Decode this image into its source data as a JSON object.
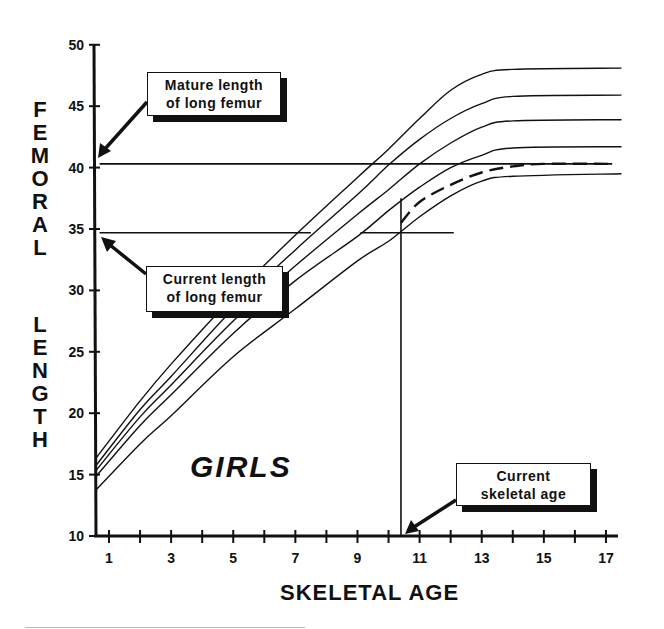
{
  "chart_data": {
    "type": "line",
    "title": "",
    "subtitle": "GIRLS",
    "xlabel": "SKELETAL AGE",
    "ylabel": "FEMORAL LENGTH",
    "xlim": [
      0.6,
      18
    ],
    "ylim": [
      10,
      50
    ],
    "x_ticks": [
      1,
      2,
      3,
      4,
      5,
      6,
      7,
      8,
      9,
      10,
      11,
      12,
      13,
      14,
      15,
      16,
      17
    ],
    "x_tick_labels": [
      "1",
      "3",
      "5",
      "7",
      "9",
      "11",
      "13",
      "15",
      "17"
    ],
    "y_ticks": [
      10,
      15,
      20,
      25,
      30,
      35,
      40,
      45,
      50
    ],
    "y_tick_labels": [
      "10",
      "15",
      "20",
      "25",
      "30",
      "35",
      "40",
      "45",
      "50"
    ],
    "grid": false,
    "legend": null,
    "x": [
      0.6,
      2,
      3,
      5,
      7,
      9,
      10,
      11,
      12,
      13,
      14,
      17.5
    ],
    "series": [
      {
        "name": "curve-1 (highest)",
        "style": "solid",
        "values": [
          16.4,
          21.0,
          24.0,
          29.5,
          34.5,
          39.2,
          41.5,
          44.0,
          46.3,
          47.6,
          48.0,
          48.1
        ]
      },
      {
        "name": "curve-2",
        "style": "solid",
        "values": [
          15.8,
          20.3,
          23.0,
          28.5,
          33.3,
          37.8,
          40.2,
          42.3,
          44.0,
          45.2,
          45.8,
          45.9
        ]
      },
      {
        "name": "curve-3",
        "style": "solid",
        "values": [
          15.4,
          19.7,
          22.3,
          27.5,
          32.0,
          36.2,
          38.2,
          40.3,
          42.0,
          43.3,
          43.8,
          43.9
        ]
      },
      {
        "name": "curve-4",
        "style": "solid",
        "values": [
          14.9,
          19.0,
          21.5,
          26.5,
          30.8,
          34.4,
          36.5,
          38.4,
          40.0,
          41.0,
          41.6,
          41.7
        ]
      },
      {
        "name": "curve-5 (lowest)",
        "style": "solid",
        "values": [
          13.8,
          17.5,
          19.8,
          24.6,
          28.5,
          32.4,
          34.0,
          36.0,
          37.7,
          38.9,
          39.3,
          39.5
        ]
      },
      {
        "name": "projected-patient-curve",
        "style": "dashed",
        "x": [
          10.4,
          11,
          12,
          13,
          14,
          15,
          17.2
        ],
        "values": [
          35.5,
          37.2,
          38.6,
          39.6,
          40.1,
          40.3,
          40.3
        ]
      }
    ],
    "reference_lines": [
      {
        "name": "mature-length",
        "orientation": "horizontal",
        "y": 40.3,
        "x_range": [
          0.6,
          17.2
        ]
      },
      {
        "name": "current-length",
        "orientation": "horizontal",
        "y": 34.7,
        "x_range": [
          0.6,
          7.5
        ]
      },
      {
        "name": "current-length-short",
        "orientation": "horizontal",
        "y": 34.7,
        "x_range": [
          9.0,
          12.1
        ]
      },
      {
        "name": "current-skeletal-age",
        "orientation": "vertical",
        "x": 10.4,
        "y_range": [
          10,
          37.5
        ]
      }
    ],
    "annotations": [
      {
        "text": "Mature length of long femur",
        "points_to": {
          "x": 0.6,
          "y": 40.3
        }
      },
      {
        "text": "Current length of long femur",
        "points_to": {
          "x": 0.6,
          "y": 34.7
        }
      },
      {
        "text": "Current skeletal age",
        "points_to": {
          "x": 10.4,
          "y": 10
        }
      }
    ]
  },
  "labels": {
    "ylabel_letters_top": [
      "F",
      "E",
      "M",
      "O",
      "R",
      "A",
      "L"
    ],
    "ylabel_letters_bottom": [
      "L",
      "E",
      "N",
      "G",
      "T",
      "H"
    ],
    "xlabel": "SKELETAL AGE",
    "group": "GIRLS"
  },
  "callouts": {
    "mature": {
      "line1": "Mature length",
      "line2": "of long femur"
    },
    "current_length": {
      "line1": "Current length",
      "line2": "of long femur"
    },
    "skeletal_age": {
      "line1": "Current",
      "line2": "skeletal age"
    }
  },
  "colors": {
    "ink": "#111111",
    "paper": "#ffffff"
  }
}
